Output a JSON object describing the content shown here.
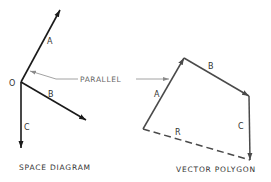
{
  "colors": {
    "space_lines": "#1a1a1a",
    "polygon_lines": "#4a4a4a",
    "leader_line": "#8a8a8a",
    "text": "#333333",
    "background": "#ffffff"
  },
  "space_diagram": {
    "caption": "SPACE DIAGRAM",
    "origin_label": "O",
    "vectors": [
      {
        "label": "A",
        "direction": "up-right"
      },
      {
        "label": "B",
        "direction": "down-right"
      },
      {
        "label": "C",
        "direction": "down"
      }
    ]
  },
  "annotation": {
    "label": "PARALLEL"
  },
  "vector_polygon": {
    "caption": "VECTOR POLYGON",
    "vectors": [
      {
        "label": "A"
      },
      {
        "label": "B"
      },
      {
        "label": "C"
      }
    ],
    "resultant": {
      "label": "R",
      "style": "dashed"
    }
  }
}
